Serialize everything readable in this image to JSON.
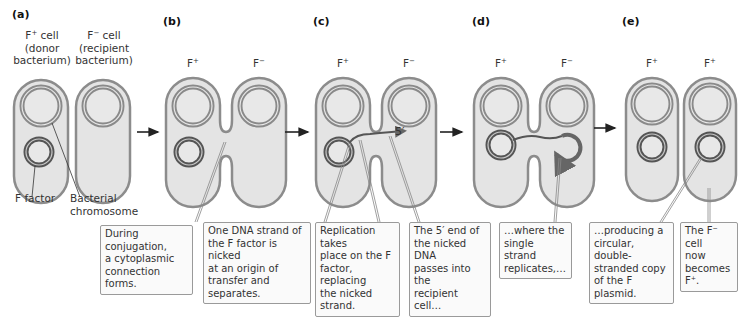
{
  "figure": {
    "panels": [
      {
        "id": "a",
        "label": "(a)",
        "cell_left": {
          "name": "F",
          "sup": "+",
          "suffix": " cell",
          "line2": "(donor",
          "line3": "bacterium)"
        },
        "cell_right": {
          "name": "F",
          "sup": "−",
          "suffix": " cell",
          "line2": "(recipient",
          "line3": "bacterium)"
        },
        "annotations": {
          "f_factor": "F factor",
          "chromosome_line1": "Bacterial",
          "chromosome_line2": "chromosome"
        },
        "callout": [
          "During conjugation,",
          "a cytoplasmic",
          "connection forms."
        ]
      },
      {
        "id": "b",
        "label": "(b)",
        "cell_left": {
          "name": "F",
          "sup": "+"
        },
        "cell_right": {
          "name": "F",
          "sup": "−"
        },
        "callout": [
          "One DNA strand of",
          "the F factor is nicked",
          "at an origin of",
          "transfer and separates."
        ]
      },
      {
        "id": "c",
        "label": "(c)",
        "cell_left": {
          "name": "F",
          "sup": "+"
        },
        "cell_right": {
          "name": "F",
          "sup": "−"
        },
        "strand_label": "5′",
        "callouts": [
          [
            "Replication takes",
            "place on the F",
            "factor, replacing",
            "the nicked strand."
          ],
          [
            "The 5′ end of",
            "the nicked DNA",
            "passes into the",
            "recipient cell…"
          ]
        ]
      },
      {
        "id": "d",
        "label": "(d)",
        "cell_left": {
          "name": "F",
          "sup": "+"
        },
        "cell_right": {
          "name": "F",
          "sup": "−"
        },
        "callout": [
          "…where the",
          "single strand",
          "replicates,…"
        ]
      },
      {
        "id": "e",
        "label": "(e)",
        "cell_left": {
          "name": "F",
          "sup": "+"
        },
        "cell_right": {
          "name": "F",
          "sup": "+"
        },
        "callouts": [
          [
            "…producing a",
            "circular, double-",
            "stranded copy",
            "of the F plasmid."
          ],
          [
            "The F⁻ cell",
            "now",
            "becomes F⁺."
          ]
        ]
      }
    ],
    "colors": {
      "cell_fill": "#e4e4e4",
      "cell_outline": "#8c8c8c",
      "chromosome_ring": "#8a8a8a",
      "plasmid_ring": "#555555",
      "arrow": "#222222",
      "callout_border": "#9a9a9a"
    }
  }
}
